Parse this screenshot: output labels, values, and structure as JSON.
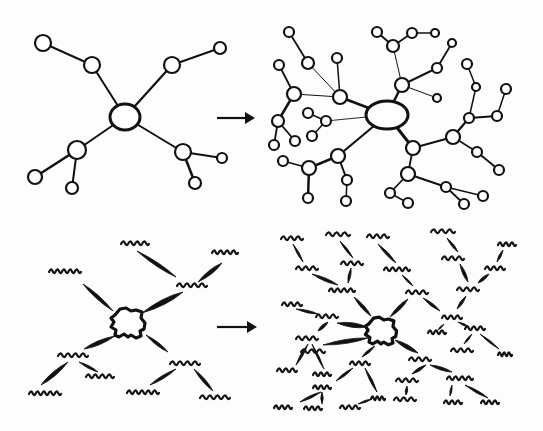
{
  "colors": {
    "ink": "#111111",
    "paper": "#fdfdfd"
  },
  "panels": [
    {
      "id": "network-small",
      "style": "circles",
      "hub": {
        "cx": 125,
        "cy": 117,
        "rx": 15,
        "ry": 13
      },
      "nodes": [
        {
          "id": "a",
          "cx": 92,
          "cy": 65,
          "r": 8
        },
        {
          "id": "a1",
          "cx": 43,
          "cy": 43,
          "r": 8
        },
        {
          "id": "b",
          "cx": 172,
          "cy": 65,
          "r": 8
        },
        {
          "id": "b1",
          "cx": 220,
          "cy": 48,
          "r": 6
        },
        {
          "id": "c",
          "cx": 77,
          "cy": 150,
          "r": 9
        },
        {
          "id": "c1",
          "cx": 35,
          "cy": 177,
          "r": 7
        },
        {
          "id": "c2",
          "cx": 72,
          "cy": 188,
          "r": 6
        },
        {
          "id": "d",
          "cx": 183,
          "cy": 152,
          "r": 8
        },
        {
          "id": "d1",
          "cx": 222,
          "cy": 158,
          "r": 5
        },
        {
          "id": "d2",
          "cx": 195,
          "cy": 183,
          "r": 6
        }
      ],
      "edges": [
        [
          "hub",
          "a",
          2
        ],
        [
          "a",
          "a1",
          2
        ],
        [
          "hub",
          "b",
          2.2
        ],
        [
          "b",
          "b1",
          2
        ],
        [
          "hub",
          "c",
          2
        ],
        [
          "c",
          "c1",
          2.5
        ],
        [
          "c",
          "c2",
          2
        ],
        [
          "hub",
          "d",
          2
        ],
        [
          "d",
          "d1",
          1.8
        ],
        [
          "d",
          "d2",
          2.5
        ]
      ]
    },
    {
      "id": "network-large",
      "style": "circles",
      "hub": {
        "cx": 387,
        "cy": 115,
        "rx": 21,
        "ry": 14
      },
      "nodes": [
        {
          "id": "A",
          "cx": 340,
          "cy": 97,
          "r": 7
        },
        {
          "id": "A1",
          "cx": 308,
          "cy": 63,
          "r": 6
        },
        {
          "id": "A11",
          "cx": 289,
          "cy": 32,
          "r": 5
        },
        {
          "id": "A2",
          "cx": 337,
          "cy": 58,
          "r": 5
        },
        {
          "id": "B",
          "cx": 294,
          "cy": 94,
          "r": 7
        },
        {
          "id": "B1",
          "cx": 279,
          "cy": 65,
          "r": 5
        },
        {
          "id": "C",
          "cx": 278,
          "cy": 121,
          "r": 6
        },
        {
          "id": "C1",
          "cx": 274,
          "cy": 145,
          "r": 5
        },
        {
          "id": "C2",
          "cx": 295,
          "cy": 141,
          "r": 5
        },
        {
          "id": "D",
          "cx": 326,
          "cy": 121,
          "r": 5
        },
        {
          "id": "D1",
          "cx": 308,
          "cy": 113,
          "r": 5
        },
        {
          "id": "D2",
          "cx": 312,
          "cy": 136,
          "r": 5
        },
        {
          "id": "E",
          "cx": 338,
          "cy": 156,
          "r": 7
        },
        {
          "id": "F",
          "cx": 309,
          "cy": 168,
          "r": 7
        },
        {
          "id": "F1",
          "cx": 283,
          "cy": 161,
          "r": 5
        },
        {
          "id": "F2",
          "cx": 308,
          "cy": 198,
          "r": 5
        },
        {
          "id": "E1",
          "cx": 347,
          "cy": 180,
          "r": 5
        },
        {
          "id": "E11",
          "cx": 346,
          "cy": 201,
          "r": 5
        },
        {
          "id": "G",
          "cx": 402,
          "cy": 85,
          "r": 7
        },
        {
          "id": "G1",
          "cx": 393,
          "cy": 46,
          "r": 6
        },
        {
          "id": "G11",
          "cx": 377,
          "cy": 32,
          "r": 5
        },
        {
          "id": "G12",
          "cx": 412,
          "cy": 33,
          "r": 5
        },
        {
          "id": "G121",
          "cx": 435,
          "cy": 33,
          "r": 4
        },
        {
          "id": "G2",
          "cx": 437,
          "cy": 68,
          "r": 5
        },
        {
          "id": "G21",
          "cx": 452,
          "cy": 43,
          "r": 4
        },
        {
          "id": "G3",
          "cx": 437,
          "cy": 98,
          "r": 4
        },
        {
          "id": "H",
          "cx": 413,
          "cy": 148,
          "r": 7
        },
        {
          "id": "I",
          "cx": 453,
          "cy": 137,
          "r": 7
        },
        {
          "id": "J",
          "cx": 469,
          "cy": 118,
          "r": 5
        },
        {
          "id": "J1",
          "cx": 476,
          "cy": 87,
          "r": 4
        },
        {
          "id": "J11",
          "cx": 467,
          "cy": 64,
          "r": 5
        },
        {
          "id": "J2",
          "cx": 497,
          "cy": 116,
          "r": 5
        },
        {
          "id": "J21",
          "cx": 506,
          "cy": 89,
          "r": 5
        },
        {
          "id": "I1",
          "cx": 477,
          "cy": 152,
          "r": 5
        },
        {
          "id": "I11",
          "cx": 499,
          "cy": 170,
          "r": 5
        },
        {
          "id": "K",
          "cx": 408,
          "cy": 174,
          "r": 7
        },
        {
          "id": "K1",
          "cx": 390,
          "cy": 193,
          "r": 5
        },
        {
          "id": "K11",
          "cx": 408,
          "cy": 203,
          "r": 5
        },
        {
          "id": "K2",
          "cx": 446,
          "cy": 187,
          "r": 5
        },
        {
          "id": "K21",
          "cx": 464,
          "cy": 204,
          "r": 5
        },
        {
          "id": "K22",
          "cx": 483,
          "cy": 196,
          "r": 5
        }
      ],
      "edges": [
        [
          "hub",
          "A",
          2.8
        ],
        [
          "A",
          "A1",
          1
        ],
        [
          "A1",
          "A11",
          1.8
        ],
        [
          "A",
          "A2",
          1.5
        ],
        [
          "A",
          "B",
          1
        ],
        [
          "B",
          "B1",
          1.8
        ],
        [
          "B",
          "C",
          2.5
        ],
        [
          "C",
          "C1",
          1.8
        ],
        [
          "C",
          "C2",
          1.8
        ],
        [
          "hub",
          "D",
          0.9
        ],
        [
          "D",
          "D1",
          1.5
        ],
        [
          "D",
          "D2",
          1.5
        ],
        [
          "hub",
          "E",
          2.2
        ],
        [
          "E",
          "F",
          2.5
        ],
        [
          "F",
          "F1",
          1.8
        ],
        [
          "F",
          "F2",
          2.5
        ],
        [
          "E",
          "E1",
          2
        ],
        [
          "E1",
          "E11",
          1.5
        ],
        [
          "hub",
          "G",
          2.5
        ],
        [
          "G",
          "G1",
          1
        ],
        [
          "G1",
          "G11",
          1.8
        ],
        [
          "G1",
          "G12",
          1.8
        ],
        [
          "G12",
          "G121",
          1.5
        ],
        [
          "G",
          "G2",
          2
        ],
        [
          "G2",
          "G21",
          1.8
        ],
        [
          "G",
          "G3",
          1
        ],
        [
          "hub",
          "H",
          3
        ],
        [
          "H",
          "I",
          2.2
        ],
        [
          "I",
          "J",
          2.2
        ],
        [
          "J",
          "J1",
          1.5
        ],
        [
          "J1",
          "J11",
          1.5
        ],
        [
          "J",
          "J2",
          1.8
        ],
        [
          "J2",
          "J21",
          1.5
        ],
        [
          "I",
          "I1",
          1.5
        ],
        [
          "I1",
          "I11",
          1.8
        ],
        [
          "H",
          "K",
          1.8
        ],
        [
          "K",
          "K1",
          1.8
        ],
        [
          "K1",
          "K11",
          1.5
        ],
        [
          "K",
          "K2",
          2.2
        ],
        [
          "K2",
          "K21",
          1.8
        ],
        [
          "K2",
          "K22",
          1.5
        ]
      ]
    },
    {
      "id": "abstract-small",
      "style": "squiggles",
      "blob": {
        "cx": 128,
        "cy": 323,
        "scale": 1.0
      },
      "squiggles": [
        {
          "id": "s1",
          "x": 135,
          "y": 243,
          "w": 28
        },
        {
          "id": "s2",
          "x": 225,
          "y": 252,
          "w": 26
        },
        {
          "id": "s3",
          "x": 192,
          "y": 285,
          "w": 30
        },
        {
          "id": "s4",
          "x": 65,
          "y": 271,
          "w": 32
        },
        {
          "id": "s5",
          "x": 73,
          "y": 355,
          "w": 30
        },
        {
          "id": "s6",
          "x": 45,
          "y": 393,
          "w": 32
        },
        {
          "id": "s7",
          "x": 100,
          "y": 376,
          "w": 28
        },
        {
          "id": "s8",
          "x": 185,
          "y": 363,
          "w": 30
        },
        {
          "id": "s9",
          "x": 143,
          "y": 392,
          "w": 32
        },
        {
          "id": "s10",
          "x": 215,
          "y": 397,
          "w": 30
        }
      ],
      "strokes": [
        [
          113,
          311,
          83,
          284,
          3.5
        ],
        [
          142,
          313,
          183,
          292,
          5
        ],
        [
          140,
          312,
          130,
          250,
          0
        ],
        [
          137,
          251,
          176,
          277,
          3.5
        ],
        [
          198,
          282,
          222,
          263,
          4
        ],
        [
          115,
          336,
          84,
          349,
          4
        ],
        [
          146,
          335,
          168,
          352,
          3
        ],
        [
          68,
          362,
          41,
          385,
          4
        ],
        [
          79,
          362,
          98,
          372,
          2.5
        ],
        [
          176,
          369,
          150,
          385,
          3
        ],
        [
          194,
          369,
          213,
          391,
          3
        ]
      ]
    },
    {
      "id": "abstract-large",
      "style": "squiggles",
      "blob": {
        "cx": 381,
        "cy": 331,
        "scale": 0.92
      },
      "squiggles": [
        {
          "id": "t1",
          "x": 292,
          "y": 238,
          "w": 22
        },
        {
          "id": "t2",
          "x": 338,
          "y": 234,
          "w": 24
        },
        {
          "id": "t3",
          "x": 378,
          "y": 236,
          "w": 22
        },
        {
          "id": "t4",
          "x": 443,
          "y": 231,
          "w": 24
        },
        {
          "id": "t5",
          "x": 507,
          "y": 244,
          "w": 18
        },
        {
          "id": "t6",
          "x": 307,
          "y": 268,
          "w": 22
        },
        {
          "id": "t7",
          "x": 352,
          "y": 263,
          "w": 22
        },
        {
          "id": "t8",
          "x": 397,
          "y": 269,
          "w": 26
        },
        {
          "id": "t9",
          "x": 453,
          "y": 258,
          "w": 22
        },
        {
          "id": "t10",
          "x": 495,
          "y": 268,
          "w": 20
        },
        {
          "id": "t11",
          "x": 342,
          "y": 290,
          "w": 26
        },
        {
          "id": "t12",
          "x": 417,
          "y": 292,
          "w": 22
        },
        {
          "id": "t13",
          "x": 468,
          "y": 289,
          "w": 22
        },
        {
          "id": "t14",
          "x": 292,
          "y": 304,
          "w": 20
        },
        {
          "id": "t15",
          "x": 327,
          "y": 316,
          "w": 22
        },
        {
          "id": "t16",
          "x": 452,
          "y": 317,
          "w": 20
        },
        {
          "id": "t17",
          "x": 475,
          "y": 328,
          "w": 20
        },
        {
          "id": "t18",
          "x": 307,
          "y": 338,
          "w": 22
        },
        {
          "id": "t19",
          "x": 437,
          "y": 332,
          "w": 18
        },
        {
          "id": "t20",
          "x": 313,
          "y": 351,
          "w": 24
        },
        {
          "id": "t21",
          "x": 462,
          "y": 350,
          "w": 22
        },
        {
          "id": "t22",
          "x": 505,
          "y": 354,
          "w": 14
        },
        {
          "id": "t23",
          "x": 287,
          "y": 370,
          "w": 20
        },
        {
          "id": "t24",
          "x": 322,
          "y": 374,
          "w": 18
        },
        {
          "id": "t25",
          "x": 360,
          "y": 363,
          "w": 20
        },
        {
          "id": "t26",
          "x": 420,
          "y": 359,
          "w": 22
        },
        {
          "id": "t27",
          "x": 322,
          "y": 387,
          "w": 18
        },
        {
          "id": "t28",
          "x": 407,
          "y": 380,
          "w": 22
        },
        {
          "id": "t29",
          "x": 460,
          "y": 378,
          "w": 26
        },
        {
          "id": "t30",
          "x": 283,
          "y": 407,
          "w": 18
        },
        {
          "id": "t31",
          "x": 313,
          "y": 408,
          "w": 18
        },
        {
          "id": "t32",
          "x": 350,
          "y": 407,
          "w": 20
        },
        {
          "id": "t33",
          "x": 378,
          "y": 398,
          "w": 14
        },
        {
          "id": "t34",
          "x": 405,
          "y": 399,
          "w": 22
        },
        {
          "id": "t35",
          "x": 453,
          "y": 402,
          "w": 18
        },
        {
          "id": "t36",
          "x": 490,
          "y": 402,
          "w": 18
        }
      ],
      "strokes": [
        [
          354,
          297,
          371,
          316,
          3.2
        ],
        [
          390,
          317,
          408,
          299,
          3.5
        ],
        [
          337,
          323,
          367,
          327,
          4.5
        ],
        [
          323,
          345,
          368,
          338,
          4
        ],
        [
          375,
          346,
          362,
          357,
          2.5
        ],
        [
          395,
          340,
          418,
          353,
          4
        ],
        [
          293,
          244,
          303,
          262,
          2.2
        ],
        [
          340,
          241,
          353,
          258,
          2.2
        ],
        [
          378,
          244,
          396,
          263,
          2.8
        ],
        [
          447,
          238,
          458,
          252,
          2.5
        ],
        [
          503,
          250,
          497,
          262,
          2.5
        ],
        [
          312,
          274,
          338,
          285,
          3
        ],
        [
          351,
          268,
          348,
          283,
          2.5
        ],
        [
          402,
          275,
          413,
          286,
          2
        ],
        [
          460,
          264,
          468,
          282,
          3
        ],
        [
          489,
          274,
          478,
          283,
          3
        ],
        [
          423,
          298,
          440,
          311,
          2.8
        ],
        [
          466,
          296,
          457,
          309,
          2.8
        ],
        [
          296,
          309,
          318,
          314,
          2.5
        ],
        [
          328,
          322,
          318,
          331,
          3
        ],
        [
          444,
          324,
          438,
          330,
          1.5
        ],
        [
          458,
          322,
          469,
          327,
          2
        ],
        [
          472,
          334,
          464,
          344,
          2
        ],
        [
          480,
          334,
          499,
          349,
          2
        ],
        [
          308,
          344,
          296,
          365,
          2.5
        ],
        [
          312,
          344,
          324,
          369,
          2
        ],
        [
          353,
          368,
          336,
          381,
          2.5
        ],
        [
          365,
          368,
          377,
          392,
          2.5
        ],
        [
          426,
          365,
          412,
          374,
          3
        ],
        [
          430,
          365,
          452,
          372,
          3
        ],
        [
          407,
          386,
          406,
          395,
          2.5
        ],
        [
          452,
          385,
          450,
          396,
          2
        ],
        [
          465,
          385,
          488,
          398,
          2.5
        ],
        [
          321,
          392,
          300,
          402,
          2.5
        ],
        [
          322,
          392,
          322,
          404,
          2.5
        ],
        [
          358,
          404,
          372,
          399,
          2
        ]
      ]
    }
  ],
  "arrows": [
    {
      "id": "arrow-top",
      "x1": 217,
      "y1": 118,
      "x2": 255,
      "y2": 118
    },
    {
      "id": "arrow-bottom",
      "x1": 217,
      "y1": 327,
      "x2": 257,
      "y2": 327
    }
  ]
}
